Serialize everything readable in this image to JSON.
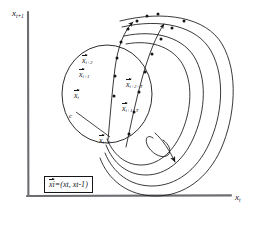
{
  "figure": {
    "kind": "hand-drawn-state-space-diagram",
    "background_color": "#ffffff",
    "ink_color": "#16161a",
    "axes": {
      "y_label": "x",
      "y_label_sub": "t+1",
      "x_label": "x",
      "x_label_sub": "t"
    },
    "labels": {
      "x_i": {
        "base": "x",
        "sub": "i"
      },
      "x_i_plus_1": {
        "base": "x",
        "sub": "i+1"
      },
      "x_i_plus_2": {
        "base": "x",
        "sub": "i+2"
      },
      "x_i_plus_T": {
        "base": "x",
        "sub": "i+T"
      },
      "x_i_plus_1_plus_T": {
        "base": "x",
        "sub": "i+1+T"
      },
      "x_i_plus_2_plus_T": {
        "base": "x",
        "sub": "i+2+T"
      },
      "epsilon": "c"
    },
    "equation": {
      "lhs_base": "x",
      "lhs_sub": "i",
      "eq": "=",
      "open": "(",
      "arg1_base": "x",
      "arg1_sub": "t",
      "comma": ",",
      "arg2_base": "x",
      "arg2_sub": "t-1",
      "close": ")"
    }
  }
}
